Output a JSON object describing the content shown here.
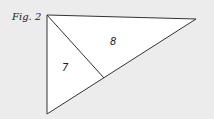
{
  "figure": {
    "label": "Fig. 2",
    "regions": [
      {
        "id": "7",
        "label": "7"
      },
      {
        "id": "8",
        "label": "8"
      }
    ],
    "colors": {
      "background": "#ececec",
      "fill": "#ffffff",
      "stroke": "#333333"
    }
  }
}
